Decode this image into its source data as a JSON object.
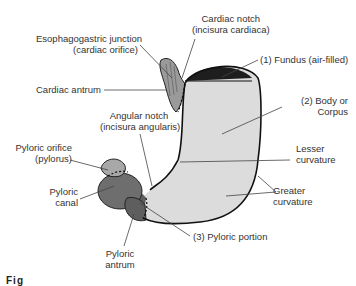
{
  "figure": {
    "colors": {
      "body_fill": "#dcdcdc",
      "fundus_air": "#1e1e1e",
      "cardiac_region": "#9a9a9a",
      "pyloric_canal": "#6e6e6e",
      "pyloric_antrum": "#5e5e5e",
      "pyloric_orifice": "#a8a8a8",
      "outline": "#111111",
      "leader_line": "#444444"
    },
    "labels": {
      "cardiac_notch": {
        "line1": "Cardiac notch",
        "line2": "(incisura cardiaca)"
      },
      "esophagogastric_junction": {
        "line1": "Esophagogastric junction",
        "line2": "(cardiac orifice)"
      },
      "fundus": "(1) Fundus (air-filled)",
      "cardiac_antrum": "Cardiac antrum",
      "body": {
        "line1": "(2) Body or",
        "line2": "Corpus"
      },
      "angular_notch": {
        "line1": "Angular notch",
        "line2": "(incisura angularis)"
      },
      "lesser_curvature": {
        "line1": "Lesser",
        "line2": "curvature"
      },
      "pyloric_orifice": {
        "line1": "Pyloric orifice",
        "line2": "(pylorus)"
      },
      "pyloric_canal": {
        "line1": "Pyloric",
        "line2": "canal"
      },
      "greater_curvature": {
        "line1": "Greater",
        "line2": "curvature"
      },
      "pyloric_portion": "(3) Pyloric portion",
      "pyloric_antrum": {
        "line1": "Pyloric",
        "line2": "antrum"
      }
    },
    "caption": {
      "prefix": "Fig",
      "text": ". 16-25  . . .  (caption cut off)"
    }
  }
}
